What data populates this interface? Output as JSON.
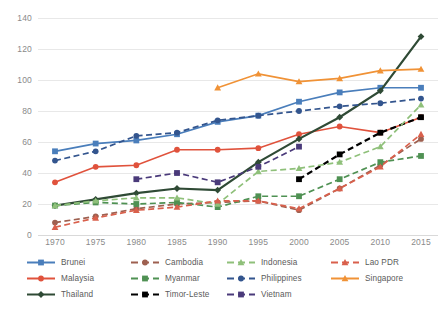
{
  "chart_data": {
    "type": "line",
    "title": "",
    "xlabel": "",
    "ylabel": "",
    "ylim": [
      0,
      140
    ],
    "ytick_step": 20,
    "grid": true,
    "legend_position": "bottom",
    "categories": [
      "1970",
      "1975",
      "1980",
      "1985",
      "1990",
      "1995",
      "2000",
      "2005",
      "2010",
      "2015"
    ],
    "ytick_labels": [
      "0",
      "20",
      "40",
      "60",
      "80",
      "100",
      "120",
      "140"
    ],
    "series": [
      {
        "name": "Brunei",
        "color": "#4a7ebb",
        "dash": "solid",
        "marker": "square",
        "values": [
          54,
          59,
          61,
          65,
          73,
          77,
          86,
          92,
          95,
          95
        ]
      },
      {
        "name": "Malaysia",
        "color": "#e0523c",
        "dash": "solid",
        "marker": "circle",
        "values": [
          34,
          44,
          45,
          55,
          55,
          56,
          65,
          70,
          66,
          76
        ]
      },
      {
        "name": "Thailand",
        "color": "#2f4a35",
        "dash": "solid",
        "marker": "diamond",
        "values": [
          19,
          23,
          27,
          30,
          29,
          47,
          62,
          76,
          93,
          128
        ]
      },
      {
        "name": "Cambodia",
        "color": "#9e6050",
        "dash": "dashed",
        "marker": "circle",
        "values": [
          8,
          12,
          17,
          20,
          21,
          22,
          16,
          30,
          45,
          62
        ]
      },
      {
        "name": "Myanmar",
        "color": "#4f9153",
        "dash": "dashed",
        "marker": "square",
        "values": [
          19,
          21,
          20,
          21,
          18,
          25,
          25,
          36,
          47,
          51
        ]
      },
      {
        "name": "Timor-Leste",
        "color": "#000000",
        "dash": "dashed",
        "marker": "square",
        "values": [
          null,
          null,
          null,
          null,
          null,
          null,
          36,
          52,
          66,
          76
        ]
      },
      {
        "name": "Indonesia",
        "color": "#8fc07a",
        "dash": "dashed",
        "marker": "triangle",
        "values": [
          19,
          22,
          24,
          24,
          20,
          41,
          43,
          47,
          57,
          84
        ]
      },
      {
        "name": "Philippines",
        "color": "#33558e",
        "dash": "dashed",
        "marker": "circle",
        "values": [
          48,
          54,
          64,
          66,
          74,
          77,
          80,
          83,
          85,
          88
        ]
      },
      {
        "name": "Vietnam",
        "color": "#4a3a7a",
        "dash": "dashed",
        "marker": "square",
        "values": [
          null,
          null,
          36,
          40,
          34,
          44,
          57,
          null,
          null,
          null
        ]
      },
      {
        "name": "Lao PDR",
        "color": "#d9604c",
        "dash": "dashed",
        "marker": "triangle",
        "values": [
          5,
          11,
          16,
          18,
          22,
          22,
          17,
          30,
          44,
          65
        ]
      },
      {
        "name": "Singapore",
        "color": "#f09236",
        "dash": "solid",
        "marker": "triangle",
        "values": [
          null,
          null,
          null,
          null,
          95,
          104,
          99,
          101,
          106,
          107
        ]
      }
    ]
  },
  "legend": {
    "columns": [
      [
        "Brunei",
        "Malaysia",
        "Thailand"
      ],
      [
        "Cambodia",
        "Myanmar",
        "Timor-Leste"
      ],
      [
        "Indonesia",
        "Philippines",
        "Vietnam"
      ],
      [
        "Lao PDR",
        "Singapore"
      ]
    ],
    "order": [
      "Brunei",
      "Cambodia",
      "Indonesia",
      "Lao PDR",
      "Malaysia",
      "Myanmar",
      "Philippines",
      "Singapore",
      "Thailand",
      "Timor-Leste",
      "Vietnam"
    ]
  }
}
